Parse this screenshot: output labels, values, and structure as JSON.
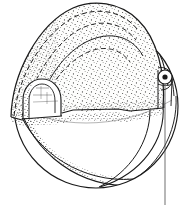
{
  "figure": {
    "title": "Cutaway sphere with stippled dome cap",
    "type": "technical-line-drawing",
    "style": "patent-ink-stipple",
    "canvas": {
      "width": 189,
      "height": 205,
      "background": "#ffffff"
    },
    "colors": {
      "ink": "#1a1a1a",
      "ink_soft": "#3a3a3a",
      "stipple": "#2b2b2b",
      "dome_fill": "#fbfbfa",
      "sphere_fill": "#ffffff",
      "axis_line": "#555555"
    },
    "parts": [
      {
        "name": "sphere-body",
        "label": "Sphere body",
        "shape": "circle",
        "center": [
          96,
          106
        ],
        "radius": 82,
        "stroke_width": 1.2
      },
      {
        "name": "dome-cap",
        "label": "Stippled dome cap (cutaway)",
        "shape": "dome",
        "apex": [
          86,
          4
        ],
        "left_base": [
          11,
          117
        ],
        "right_base": [
          163,
          108
        ],
        "stippled": true,
        "stipple_density": 420
      },
      {
        "name": "arch-opening",
        "label": "Arched opening in dome skirt",
        "shape": "arch",
        "bounds": [
          22,
          78,
          42,
          36
        ]
      },
      {
        "name": "pivot-eyelet",
        "label": "Pivot eyelet / hinge boss",
        "shape": "ring-with-dot",
        "center": [
          165,
          77
        ],
        "outer_radius": 7,
        "inner_radius": 2.6
      },
      {
        "name": "axis-line",
        "label": "Vertical axis reference line",
        "shape": "line",
        "from": [
          165,
          84
        ],
        "to": [
          165,
          205
        ]
      },
      {
        "name": "lune-curves",
        "label": "Longitudinal lune seam curves on sphere",
        "count": 5
      },
      {
        "name": "hidden-edges",
        "label": "Hidden edge dashed arcs on dome",
        "count": 3,
        "dash": "5 3"
      }
    ],
    "annotations": []
  }
}
